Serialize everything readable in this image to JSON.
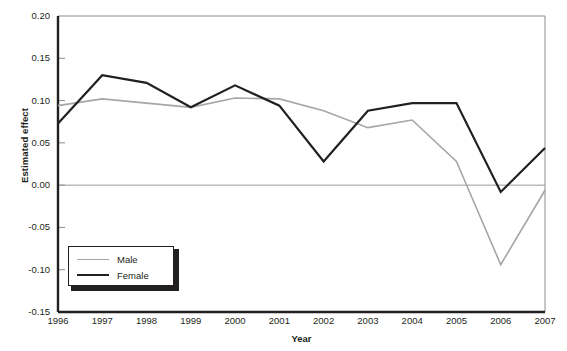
{
  "chart_data": {
    "type": "line",
    "title": "",
    "xlabel": "Year",
    "ylabel": "Estimated effect",
    "x": [
      1996,
      1997,
      1998,
      1999,
      2000,
      2001,
      2002,
      2003,
      2004,
      2005,
      2006,
      2007
    ],
    "xticklabels": [
      "1996",
      "1997",
      "1998",
      "1999",
      "2000",
      "2001",
      "2002",
      "2003",
      "2004",
      "2005",
      "2006",
      "2007"
    ],
    "yticklabels": [
      "0.20",
      "0.15",
      "0.10",
      "0.05",
      "0.00",
      "-0.05",
      "-0.10",
      "-0.15"
    ],
    "yticks": [
      0.2,
      0.15,
      0.1,
      0.05,
      0.0,
      -0.05,
      -0.1,
      -0.15
    ],
    "xlim": [
      1996,
      2007
    ],
    "ylim": [
      -0.15,
      0.2
    ],
    "grid": false,
    "zero_line": 0.0,
    "legend_position": "lower left",
    "series": [
      {
        "name": "Male",
        "color": "#a6a6a6",
        "width": 1.6,
        "values": [
          0.094,
          0.102,
          0.097,
          0.092,
          0.103,
          0.102,
          0.088,
          0.068,
          0.077,
          0.028,
          -0.094,
          -0.006
        ]
      },
      {
        "name": "Female",
        "color": "#231f20",
        "width": 2.2,
        "values": [
          0.073,
          0.13,
          0.121,
          0.092,
          0.118,
          0.094,
          0.028,
          0.088,
          0.097,
          0.097,
          -0.008,
          0.044
        ]
      }
    ]
  }
}
